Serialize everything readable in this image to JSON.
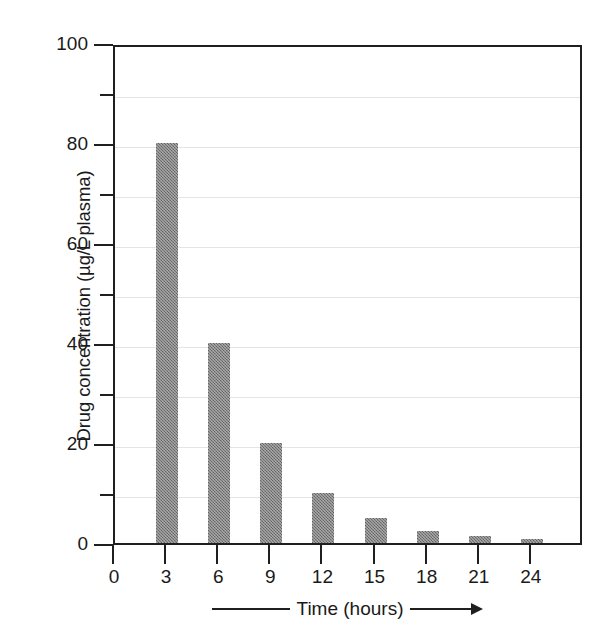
{
  "chart_data": {
    "type": "bar",
    "title": "",
    "subtitle": "",
    "xlabel": "Time (hours)",
    "ylabel": "Drug concentration (µg/L plasma)",
    "categories": [
      "3",
      "6",
      "9",
      "12",
      "15",
      "18",
      "21",
      "24"
    ],
    "values": [
      80,
      40,
      20,
      10,
      5,
      2.5,
      1.5,
      0.8
    ],
    "series": [
      {
        "name": "Drug concentration",
        "values": [
          80,
          40,
          20,
          10,
          5,
          2.5,
          1.5,
          0.8
        ]
      }
    ],
    "x": [
      3,
      6,
      9,
      12,
      15,
      18,
      21,
      24
    ],
    "xlim": [
      0,
      27
    ],
    "ylim": [
      0,
      100
    ],
    "x_ticks": [
      0,
      3,
      6,
      9,
      12,
      15,
      18,
      21,
      24
    ],
    "x_tick_labels": [
      "0",
      "3",
      "6",
      "9",
      "12",
      "15",
      "18",
      "21",
      "24"
    ],
    "y_ticks_major": [
      0,
      20,
      40,
      60,
      80,
      100
    ],
    "y_tick_labels": [
      "0",
      "20",
      "40",
      "60",
      "80",
      "100"
    ],
    "y_ticks_minor": [
      10,
      30,
      50,
      70,
      90
    ],
    "grid": true,
    "grid_axis": "y",
    "legend": "none",
    "bar_color": "#7b7b7b",
    "axis_color": "#1f1f1f",
    "grid_color": "#e4e4e4",
    "background_color": "#ffffff"
  }
}
